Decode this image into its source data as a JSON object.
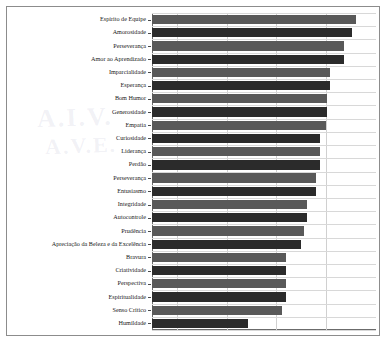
{
  "chart_data": {
    "type": "bar",
    "orientation": "horizontal",
    "title": "",
    "subtitle": "",
    "xlabel": "",
    "ylabel": "",
    "xlim": [
      0,
      4.5
    ],
    "ylim": null,
    "grid": "vertical",
    "legend": null,
    "xticks": [
      0.5,
      1.5,
      2.5,
      3.5
    ],
    "xticklabels": [
      "",
      "",
      "",
      ""
    ],
    "categories": [
      "Espírito de Equipe",
      "Amorosidade",
      "Perseverança",
      "Amor ao Aprendizado",
      "Imparcialidade",
      "Esperança",
      "Bom Humor",
      "Generosidade",
      "Empatia",
      "Curiosidade",
      "Liderança",
      "Perdão",
      "Perseverança",
      "Entusiasmo",
      "Integridade",
      "Autocontrole",
      "Prudência",
      "Apreciação da Beleza e da Excelência",
      "Bravura",
      "Criatividade",
      "Perspectiva",
      "Espiritualidade",
      "Senso Crítico",
      "Humildade"
    ],
    "values": [
      4.1,
      4.01,
      3.86,
      3.86,
      3.58,
      3.57,
      3.52,
      3.51,
      3.5,
      3.38,
      3.37,
      3.37,
      3.3,
      3.3,
      3.11,
      3.12,
      3.06,
      2.99,
      2.7,
      2.7,
      2.69,
      2.69,
      2.62,
      1.93
    ],
    "bar_colors": [
      "#595959",
      "#2b2b2b"
    ],
    "bar_color_pattern": "alternating"
  },
  "figure": {
    "watermark_line1": "A.I.V.",
    "watermark_line2": "A.V.E.",
    "frame_color": "#8c8c8c",
    "grid_color": "#d0d0d0",
    "axis_color": "#6b6b6b",
    "background": "#ffffff"
  }
}
